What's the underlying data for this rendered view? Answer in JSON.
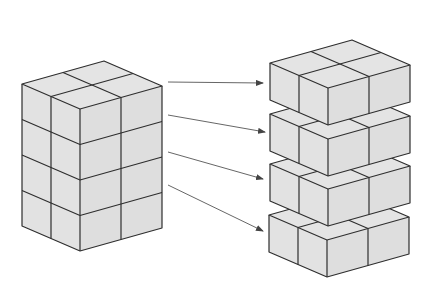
{
  "diagram": {
    "colors": {
      "face": "#e2e2e2",
      "edge": "#2e2e2e",
      "arrow": "#555555",
      "background": "#ffffff"
    },
    "cube": {
      "left_dx": 29,
      "left_dy": 12.5,
      "right_dx": 41,
      "right_dy": -11.5,
      "height": 35.5
    },
    "source_block": {
      "cols_left": 2,
      "cols_right": 2,
      "layers": 4,
      "front_top": [
        80,
        109
      ]
    },
    "layers": {
      "count": 4,
      "cols_left": 2,
      "cols_right": 2,
      "front_tops": [
        [
          328,
          88
        ],
        [
          328,
          139
        ],
        [
          328,
          189
        ],
        [
          327,
          240
        ]
      ],
      "height": 37
    },
    "arrows": [
      {
        "from": [
          168,
          82
        ],
        "to": [
          263,
          83
        ]
      },
      {
        "from": [
          168,
          115
        ],
        "to": [
          265,
          132
        ]
      },
      {
        "from": [
          168,
          152
        ],
        "to": [
          263,
          179
        ]
      },
      {
        "from": [
          168,
          185
        ],
        "to": [
          263,
          231
        ]
      }
    ]
  }
}
